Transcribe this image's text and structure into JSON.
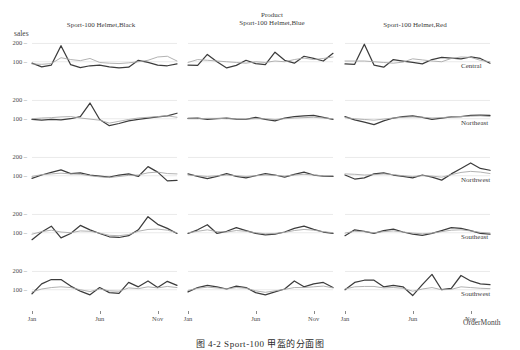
{
  "figure": {
    "caption": "图 4-2  Sport-100 甲盔的分面图",
    "y_axis_title": "sales",
    "x_axis_title": "OrderMonth",
    "column_super_label": "Product",
    "background": "#ffffff",
    "series_colors": {
      "series_a": "#3c3c3c",
      "series_b": "#a9a9a9"
    }
  },
  "chart_data": {
    "type": "line",
    "title": "",
    "xlabel": "OrderMonth",
    "ylabel": "sales",
    "grid": true,
    "legend": "none",
    "ylim": [
      0,
      230
    ],
    "yticks": [
      100,
      200
    ],
    "x": [
      "Jan",
      "Feb",
      "Mar",
      "Apr",
      "May",
      "Jun",
      "Jul",
      "Aug",
      "Sep",
      "Oct",
      "Nov",
      "Dec"
    ],
    "xticks": [
      "Jan",
      "Jun",
      "Nov"
    ],
    "facet_columns": [
      "Sport-100 Helmet,Black",
      "Sport-100 Helmet,Blue",
      "Sport-100 Helmet,Red"
    ],
    "facet_rows": [
      "Central",
      "Northeast",
      "Northwest",
      "Southeast",
      "Southwest"
    ],
    "panels": [
      {
        "row": "Central",
        "column": "Sport-100 Helmet,Black",
        "series": [
          {
            "name": "series_a",
            "values": [
              92,
              72,
              82,
              188,
              84,
              68,
              78,
              82,
              72,
              66,
              70,
              108,
              96,
              82,
              78,
              88
            ]
          },
          {
            "name": "series_b",
            "values": [
              88,
              86,
              90,
              122,
              112,
              106,
              118,
              96,
              92,
              90,
              94,
              100,
              108,
              126,
              130,
              104
            ]
          }
        ]
      },
      {
        "row": "Central",
        "column": "Sport-100 Helmet,Blue",
        "series": [
          {
            "name": "series_a",
            "values": [
              82,
              80,
              140,
              100,
              66,
              80,
              108,
              90,
              84,
              152,
              108,
              92,
              130,
              118,
              104,
              146
            ]
          },
          {
            "name": "series_b",
            "values": [
              96,
              112,
              108,
              104,
              100,
              96,
              92,
              100,
              96,
              104,
              100,
              112,
              120,
              112,
              118,
              126
            ]
          }
        ]
      },
      {
        "row": "Central",
        "column": "Sport-100 Helmet,Red",
        "series": [
          {
            "name": "series_a",
            "values": [
              88,
              86,
              196,
              82,
              70,
              112,
              104,
              96,
              88,
              112,
              124,
              120,
              116,
              126,
              118,
              92
            ]
          },
          {
            "name": "series_b",
            "values": [
              104,
              104,
              104,
              100,
              96,
              92,
              98,
              116,
              110,
              104,
              100,
              118,
              126,
              124,
              108,
              100
            ]
          }
        ]
      },
      {
        "row": "Northeast",
        "column": "Sport-100 Helmet,Black",
        "series": [
          {
            "name": "series_a",
            "values": [
              96,
              92,
              96,
              94,
              100,
              112,
              186,
              96,
              62,
              74,
              88,
              96,
              104,
              110,
              116,
              130
            ]
          },
          {
            "name": "series_b",
            "values": [
              100,
              104,
              106,
              110,
              112,
              104,
              98,
              92,
              76,
              86,
              96,
              104,
              108,
              112,
              116,
              108
            ]
          }
        ]
      },
      {
        "row": "Northeast",
        "column": "Sport-100 Helmet,Blue",
        "series": [
          {
            "name": "series_a",
            "values": [
              102,
              104,
              96,
              100,
              104,
              98,
              96,
              108,
              96,
              88,
              104,
              112,
              116,
              118,
              108,
              96
            ]
          },
          {
            "name": "series_b",
            "values": [
              100,
              100,
              102,
              102,
              100,
              100,
              98,
              100,
              100,
              96,
              100,
              104,
              106,
              108,
              104,
              100
            ]
          }
        ]
      },
      {
        "row": "Northeast",
        "column": "Sport-100 Helmet,Red",
        "series": [
          {
            "name": "series_a",
            "values": [
              112,
              94,
              82,
              68,
              88,
              104,
              112,
              116,
              108,
              96,
              104,
              110,
              112,
              118,
              120,
              118
            ]
          },
          {
            "name": "series_b",
            "values": [
              106,
              100,
              96,
              92,
              98,
              104,
              108,
              110,
              108,
              104,
              106,
              110,
              112,
              114,
              116,
              112
            ]
          }
        ]
      },
      {
        "row": "Northwest",
        "column": "Sport-100 Helmet,Black",
        "series": [
          {
            "name": "series_a",
            "values": [
              86,
              104,
              118,
              132,
              112,
              116,
              104,
              98,
              92,
              104,
              110,
              96,
              150,
              120,
              72,
              74
            ]
          },
          {
            "name": "series_b",
            "values": [
              96,
              106,
              110,
              114,
              110,
              108,
              100,
              94,
              90,
              96,
              102,
              104,
              116,
              120,
              112,
              110
            ]
          }
        ]
      },
      {
        "row": "Northwest",
        "column": "Sport-100 Helmet,Blue",
        "series": [
          {
            "name": "series_a",
            "values": [
              110,
              96,
              84,
              96,
              112,
              96,
              88,
              100,
              112,
              104,
              92,
              108,
              120,
              104,
              98,
              96
            ]
          },
          {
            "name": "series_b",
            "values": [
              104,
              100,
              96,
              100,
              104,
              100,
              96,
              100,
              104,
              102,
              98,
              104,
              108,
              104,
              100,
              100
            ]
          }
        ]
      },
      {
        "row": "Northwest",
        "column": "Sport-100 Helmet,Red",
        "series": [
          {
            "name": "series_a",
            "values": [
              104,
              82,
              88,
              110,
              116,
              104,
              96,
              88,
              104,
              92,
              76,
              110,
              140,
              170,
              140,
              130
            ]
          },
          {
            "name": "series_b",
            "values": [
              110,
              108,
              104,
              106,
              110,
              106,
              100,
              96,
              100,
              98,
              92,
              106,
              118,
              124,
              120,
              112
            ]
          }
        ]
      },
      {
        "row": "Southeast",
        "column": "Sport-100 Helmet,Black",
        "series": [
          {
            "name": "series_a",
            "values": [
              62,
              104,
              136,
              72,
              96,
              140,
              116,
              96,
              78,
              74,
              84,
              116,
              188,
              146,
              124,
              96
            ]
          },
          {
            "name": "series_b",
            "values": [
              92,
              106,
              114,
              104,
              100,
              110,
              108,
              98,
              86,
              84,
              90,
              108,
              118,
              120,
              114,
              100
            ]
          }
        ]
      },
      {
        "row": "Southeast",
        "column": "Sport-100 Helmet,Blue",
        "series": [
          {
            "name": "series_a",
            "values": [
              96,
              116,
              144,
              96,
              108,
              128,
              112,
              96,
              88,
              92,
              104,
              124,
              136,
              118,
              104,
              96
            ]
          },
          {
            "name": "series_b",
            "values": [
              100,
              108,
              116,
              106,
              104,
              112,
              108,
              100,
              94,
              96,
              102,
              112,
              118,
              114,
              106,
              100
            ]
          }
        ]
      },
      {
        "row": "Southeast",
        "column": "Sport-100 Helmet,Red",
        "series": [
          {
            "name": "series_a",
            "values": [
              84,
              116,
              108,
              96,
              112,
              120,
              104,
              92,
              86,
              96,
              112,
              128,
              124,
              112,
              96,
              92
            ]
          },
          {
            "name": "series_b",
            "values": [
              98,
              108,
              106,
              100,
              106,
              110,
              104,
              98,
              94,
              98,
              106,
              114,
              116,
              110,
              102,
              98
            ]
          }
        ]
      },
      {
        "row": "Southwest",
        "column": "Sport-100 Helmet,Black",
        "series": [
          {
            "name": "series_a",
            "values": [
              78,
              132,
              156,
              156,
              120,
              92,
              72,
              112,
              84,
              80,
              140,
              116,
              148,
              112,
              146,
              124
            ]
          },
          {
            "name": "series_b",
            "values": [
              88,
              104,
              112,
              116,
              112,
              100,
              90,
              104,
              94,
              92,
              110,
              106,
              116,
              110,
              118,
              112
            ]
          }
        ]
      },
      {
        "row": "Southwest",
        "column": "Sport-100 Helmet,Blue",
        "series": [
          {
            "name": "series_a",
            "values": [
              88,
              112,
              124,
              116,
              104,
              120,
              112,
              84,
              72,
              88,
              104,
              148,
              116,
              132,
              140,
              112
            ]
          },
          {
            "name": "series_b",
            "values": [
              96,
              108,
              114,
              110,
              104,
              112,
              108,
              94,
              86,
              94,
              102,
              112,
              112,
              116,
              120,
              110
            ]
          }
        ]
      },
      {
        "row": "Southwest",
        "column": "Sport-100 Helmet,Red",
        "series": [
          {
            "name": "series_a",
            "values": [
              100,
              140,
              152,
              152,
              116,
              124,
              116,
              68,
              128,
              184,
              100,
              108,
              178,
              148,
              132,
              128
            ]
          },
          {
            "name": "series_b",
            "values": [
              104,
              116,
              118,
              118,
              110,
              112,
              108,
              92,
              104,
              112,
              100,
              102,
              116,
              112,
              108,
              106
            ]
          }
        ]
      }
    ]
  }
}
